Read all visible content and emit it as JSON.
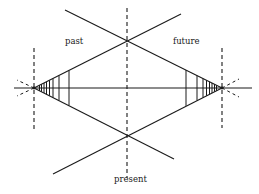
{
  "diagram": {
    "type": "time-cone diagram",
    "labels": {
      "past": "past",
      "future": "future",
      "present": "present"
    },
    "colors": {
      "line": "#1a1a1a",
      "text": "#222222",
      "background": "#ffffff"
    },
    "elements": {
      "horizontal_axis": "solid line through both apexes",
      "center_axis": "dashed vertical line marking the present",
      "left_apex_axis": "dashed vertical line at left vanishing point",
      "right_apex_axis": "dashed vertical line at right vanishing point",
      "left_hatching_count": 8,
      "right_hatching_count": 8
    }
  }
}
